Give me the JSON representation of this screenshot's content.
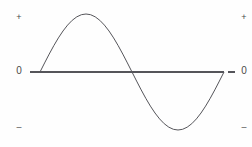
{
  "figure": {
    "background_color": "#fefefe",
    "line_color": "#55555a",
    "label_color": "#4a4a4a"
  },
  "left_axis": {
    "positive_label": "+",
    "zero_label": "0",
    "negative_label": "–"
  },
  "right_axis": {
    "positive_label": "+",
    "zero_label": "0",
    "negative_label": "–"
  },
  "chart_data": {
    "type": "line",
    "title": "",
    "subtitle": "",
    "xlabel": "",
    "ylabel": "",
    "grid": false,
    "legend": [],
    "legend_position": "none",
    "axis_baseline_value": 0,
    "xlim": [
      0,
      1
    ],
    "ylim": [
      -1,
      1
    ],
    "y_tick_labels": [
      "+",
      "0",
      "–"
    ],
    "y_tick_values": [
      1,
      0,
      -1
    ],
    "x_tick_labels": [],
    "annotations": [
      {
        "text": "peak",
        "x": 0.25,
        "y": 1
      },
      {
        "text": "zero crossing",
        "x": 0.5,
        "y": 0
      },
      {
        "text": "trough",
        "x": 0.75,
        "y": -1
      }
    ],
    "series": [
      {
        "name": "sine",
        "color": "#55555a",
        "x": [
          0,
          0.025,
          0.05,
          0.075,
          0.1,
          0.125,
          0.15,
          0.175,
          0.2,
          0.225,
          0.25,
          0.275,
          0.3,
          0.325,
          0.35,
          0.375,
          0.4,
          0.425,
          0.45,
          0.475,
          0.5,
          0.525,
          0.55,
          0.575,
          0.6,
          0.625,
          0.65,
          0.675,
          0.7,
          0.725,
          0.75,
          0.775,
          0.8,
          0.825,
          0.85,
          0.875,
          0.9,
          0.925,
          0.95,
          0.975,
          1
        ],
        "y": [
          0,
          0.156,
          0.309,
          0.454,
          0.588,
          0.707,
          0.809,
          0.891,
          0.951,
          0.988,
          1,
          0.988,
          0.951,
          0.891,
          0.809,
          0.707,
          0.588,
          0.454,
          0.309,
          0.156,
          0,
          -0.156,
          -0.309,
          -0.454,
          -0.588,
          -0.707,
          -0.809,
          -0.891,
          -0.951,
          -0.988,
          -1,
          -0.988,
          -0.951,
          -0.891,
          -0.809,
          -0.707,
          -0.588,
          -0.454,
          -0.309,
          -0.156,
          0
        ]
      }
    ]
  },
  "plot_geometry": {
    "x_start_px": 40,
    "x_end_px": 224,
    "baseline_y_px": 72,
    "amplitude_px": 58,
    "axis_x_start_px": 30,
    "axis_x_end_px": 224
  }
}
